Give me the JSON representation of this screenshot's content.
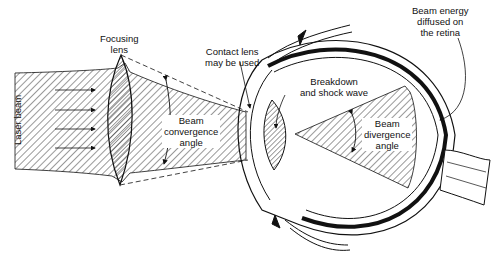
{
  "figure": {
    "type": "laser-eye-interaction-diagram",
    "colors": {
      "line": "#111111",
      "hatch": "#333333",
      "background": "#ffffff"
    }
  },
  "labels": {
    "laser_beam": "Laser beam",
    "focusing_lens": [
      "Focusing",
      "lens"
    ],
    "contact_lens": [
      "Contact lens",
      "may be used"
    ],
    "beam_energy": [
      "Beam energy",
      "diffused on",
      "the retina"
    ],
    "breakdown": [
      "Breakdown",
      "and shock wave"
    ],
    "convergence": [
      "Beam",
      "convergence",
      "angle"
    ],
    "divergence": [
      "Beam",
      "divergence",
      "angle"
    ]
  }
}
